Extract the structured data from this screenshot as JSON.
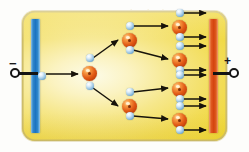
{
  "figure": {
    "background_color": "#fdfdfb"
  },
  "chamber": {
    "name": "gas-filled chamber",
    "fill_color": "#f2dc54",
    "border_color": "#cdbd6b",
    "corner_radius_px": 13
  },
  "electrodes": {
    "cathode": {
      "label": "cathode-plate",
      "polarity_sign": "−",
      "color": "#1d73c0",
      "side": "left"
    },
    "anode": {
      "label": "anode-plate",
      "polarity_sign": "+",
      "color": "#d4440f",
      "side": "right"
    }
  },
  "terminals": {
    "negative": {
      "name": "negative-terminal",
      "shape": "open-circle"
    },
    "positive": {
      "name": "positive-terminal",
      "shape": "open-circle"
    }
  },
  "particles": {
    "ion": {
      "name": "positive-ion",
      "color": "#e25b16",
      "diameter_px": 15,
      "count": 7
    },
    "electron": {
      "name": "electron",
      "color": "#9cc6e4",
      "diameter_px": 8,
      "count": 17
    }
  },
  "ghost_text": {
    "note": "faint bleed-through text from the reverse side of the scanned page",
    "lines": [
      {
        "text": "ionization",
        "x": 118,
        "y": 6,
        "size": 11,
        "opacity": 0.13,
        "color": "#c8a23a"
      },
      {
        "text": "the electrons are",
        "x": 40,
        "y": 40,
        "size": 10,
        "opacity": 0.1,
        "color": "#c9a84c"
      },
      {
        "text": "ions and the",
        "x": 52,
        "y": 62,
        "size": 10,
        "opacity": 0.09,
        "color": "#c9a84c"
      },
      {
        "text": "a current flows",
        "x": 46,
        "y": 84,
        "size": 10,
        "opacity": 0.09,
        "color": "#c9a84c"
      },
      {
        "text": "electron avalanche",
        "x": 40,
        "y": 103,
        "size": 10,
        "opacity": 0.11,
        "color": "#c08f33"
      },
      {
        "text": "strong electric",
        "x": 56,
        "y": 128,
        "size": 10,
        "opacity": 0.12,
        "color": "#c08f33"
      }
    ]
  },
  "ions": [
    {
      "id": "ion-gen1",
      "x": 82,
      "y": 66
    },
    {
      "id": "ion-gen2-up",
      "x": 122,
      "y": 33
    },
    {
      "id": "ion-gen2-dn",
      "x": 122,
      "y": 99
    },
    {
      "id": "ion-gen3-a",
      "x": 172,
      "y": 20
    },
    {
      "id": "ion-gen3-b",
      "x": 172,
      "y": 53
    },
    {
      "id": "ion-gen3-c",
      "x": 172,
      "y": 82
    },
    {
      "id": "ion-gen3-d",
      "x": 172,
      "y": 113
    }
  ],
  "electrons": [
    {
      "id": "e-seed",
      "x": 38,
      "y": 72
    },
    {
      "id": "e-g1-up",
      "x": 86,
      "y": 54
    },
    {
      "id": "e-g1-dn",
      "x": 86,
      "y": 82
    },
    {
      "id": "e-g2a-up",
      "x": 126,
      "y": 22
    },
    {
      "id": "e-g2a-dn",
      "x": 126,
      "y": 46
    },
    {
      "id": "e-g2b-up",
      "x": 126,
      "y": 88
    },
    {
      "id": "e-g2b-dn",
      "x": 126,
      "y": 112
    },
    {
      "id": "e-g3a-up",
      "x": 176,
      "y": 9
    },
    {
      "id": "e-g3a-dn",
      "x": 176,
      "y": 33
    },
    {
      "id": "e-g3b-up",
      "x": 176,
      "y": 42
    },
    {
      "id": "e-g3b-dn",
      "x": 176,
      "y": 66
    },
    {
      "id": "e-g3c-up",
      "x": 176,
      "y": 71
    },
    {
      "id": "e-g3c-dn",
      "x": 176,
      "y": 95
    },
    {
      "id": "e-g3d-up",
      "x": 176,
      "y": 102
    },
    {
      "id": "e-g3d-dn",
      "x": 176,
      "y": 126
    }
  ],
  "arrows": [
    {
      "id": "arrow-seed-to-gen1",
      "x1": 46,
      "y1": 74,
      "x2": 78,
      "y2": 74
    },
    {
      "id": "arrow-gen1-up",
      "x1": 93,
      "y1": 58,
      "x2": 118,
      "y2": 40
    },
    {
      "id": "arrow-gen1-dn",
      "x1": 93,
      "y1": 88,
      "x2": 118,
      "y2": 106
    },
    {
      "id": "arrow-gen2a-up",
      "x1": 133,
      "y1": 26,
      "x2": 168,
      "y2": 26
    },
    {
      "id": "arrow-gen2a-dn",
      "x1": 133,
      "y1": 50,
      "x2": 168,
      "y2": 59
    },
    {
      "id": "arrow-gen2b-up",
      "x1": 133,
      "y1": 92,
      "x2": 168,
      "y2": 88
    },
    {
      "id": "arrow-gen2b-dn",
      "x1": 133,
      "y1": 116,
      "x2": 168,
      "y2": 119
    },
    {
      "id": "arrow-out-1",
      "x1": 183,
      "y1": 13,
      "x2": 206,
      "y2": 13
    },
    {
      "id": "arrow-out-2",
      "x1": 183,
      "y1": 37,
      "x2": 206,
      "y2": 37
    },
    {
      "id": "arrow-out-3",
      "x1": 183,
      "y1": 46,
      "x2": 206,
      "y2": 46
    },
    {
      "id": "arrow-out-4",
      "x1": 183,
      "y1": 70,
      "x2": 206,
      "y2": 70
    },
    {
      "id": "arrow-out-5",
      "x1": 183,
      "y1": 75,
      "x2": 206,
      "y2": 75
    },
    {
      "id": "arrow-out-6",
      "x1": 183,
      "y1": 99,
      "x2": 206,
      "y2": 99
    },
    {
      "id": "arrow-out-7",
      "x1": 183,
      "y1": 106,
      "x2": 206,
      "y2": 106
    },
    {
      "id": "arrow-out-8",
      "x1": 183,
      "y1": 130,
      "x2": 206,
      "y2": 130
    }
  ]
}
